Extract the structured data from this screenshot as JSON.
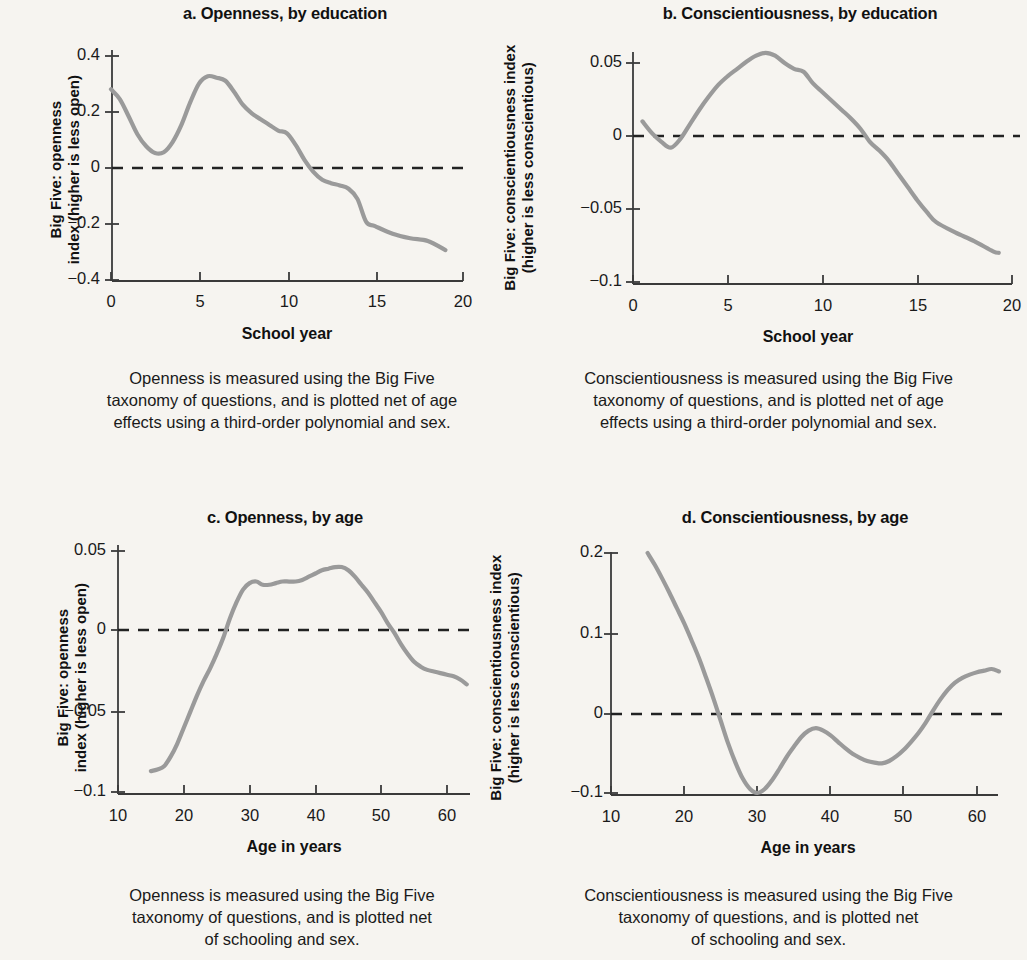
{
  "figure": {
    "background_color": "#f6f4f0",
    "line_color": "#9a9a9a",
    "axis_color": "#3a3a3a"
  },
  "panels": {
    "a": {
      "title": "a. Openness, by education",
      "ylabel_line1": "Big Five: openness",
      "ylabel_line2": "index (higher is less open)",
      "xlabel": "School year",
      "ytick_labels": [
        "0.4",
        "0.2",
        "0",
        "−0.2",
        "−0.4"
      ],
      "xtick_labels": [
        "0",
        "5",
        "10",
        "15",
        "20"
      ],
      "caption_line1": "Openness is measured using the Big Five",
      "caption_line2": "taxonomy of questions, and is plotted net of age",
      "caption_line3": "effects using a third-order polynomial and sex."
    },
    "b": {
      "title": "b. Conscientiousness, by education",
      "ylabel_line1": "Big Five: conscientiousness index",
      "ylabel_line2": "(higher is less conscientious)",
      "xlabel": "School year",
      "ytick_labels": [
        "0.05",
        "0",
        "−0.05",
        "−0.1"
      ],
      "xtick_labels": [
        "0",
        "5",
        "10",
        "15",
        "20"
      ],
      "caption_line1": "Conscientiousness is measured using the Big Five",
      "caption_line2": "taxonomy of questions, and is plotted net of age",
      "caption_line3": "effects using a third-order polynomial and sex."
    },
    "c": {
      "title": "c. Openness, by age",
      "ylabel_line1": "Big Five: openness",
      "ylabel_line2": "index (higher is less open)",
      "xlabel": "Age in years",
      "ytick_labels": [
        "0.05",
        "0",
        "−0.05",
        "−0.1"
      ],
      "xtick_labels": [
        "10",
        "20",
        "30",
        "40",
        "50",
        "60"
      ],
      "caption_line1": "Openness is measured using the Big Five",
      "caption_line2": "taxonomy of questions, and is plotted net",
      "caption_line3": "of schooling and sex."
    },
    "d": {
      "title": "d. Conscientiousness, by age",
      "ylabel_line1": "Big Five: conscientiousness index",
      "ylabel_line2": "(higher is less conscientious)",
      "xlabel": "Age in years",
      "ytick_labels": [
        "0.2",
        "0.1",
        "0",
        "−0.1"
      ],
      "xtick_labels": [
        "10",
        "20",
        "30",
        "40",
        "50",
        "60"
      ],
      "caption_line1": "Conscientiousness is measured using the Big Five",
      "caption_line2": "taxonomy of questions, and is plotted net",
      "caption_line3": "of schooling and sex."
    }
  },
  "chart_data": [
    {
      "type": "line",
      "title": "a. Openness, by education",
      "xlabel": "School year",
      "ylabel": "Big Five: openness index (higher is less open)",
      "xlim": [
        0,
        20
      ],
      "ylim": [
        -0.4,
        0.4
      ],
      "xticks": [
        0,
        5,
        10,
        15,
        20
      ],
      "yticks": [
        0.4,
        0.2,
        0,
        -0.2,
        -0.4
      ],
      "grid": false,
      "legend": null,
      "reference_line_y": 0,
      "x": [
        0,
        0.5,
        1,
        1.5,
        2,
        2.5,
        3,
        3.5,
        4,
        4.5,
        5,
        5.5,
        6,
        6.5,
        7,
        7.5,
        8,
        8.5,
        9,
        9.5,
        10,
        10.5,
        11,
        11.5,
        12,
        12.5,
        13,
        13.5,
        14,
        14.5,
        15,
        16,
        17,
        18,
        19
      ],
      "y": [
        0.282,
        0.247,
        0.186,
        0.122,
        0.079,
        0.055,
        0.058,
        0.094,
        0.155,
        0.235,
        0.302,
        0.328,
        0.323,
        0.312,
        0.272,
        0.226,
        0.196,
        0.175,
        0.155,
        0.135,
        0.125,
        0.083,
        0.03,
        -0.012,
        -0.04,
        -0.052,
        -0.06,
        -0.072,
        -0.108,
        -0.19,
        -0.205,
        -0.232,
        -0.248,
        -0.258,
        -0.29
      ]
    },
    {
      "type": "line",
      "title": "b. Conscientiousness, by education",
      "xlabel": "School year",
      "ylabel": "Big Five: conscientiousness index (higher is less conscientious)",
      "xlim": [
        0,
        20
      ],
      "ylim": [
        -0.1,
        0.065
      ],
      "xticks": [
        0,
        5,
        10,
        15,
        20
      ],
      "yticks": [
        0.05,
        0,
        -0.05,
        -0.1
      ],
      "grid": false,
      "legend": null,
      "reference_line_y": 0,
      "x": [
        0.5,
        1,
        1.5,
        2,
        2.5,
        3,
        3.5,
        4,
        4.5,
        5,
        5.5,
        6,
        6.5,
        7,
        7.5,
        8,
        8.5,
        9,
        9.5,
        10,
        10.5,
        11,
        11.5,
        12,
        12.5,
        13,
        13.5,
        14,
        14.5,
        15,
        15.5,
        16,
        17,
        18,
        19,
        19.3
      ],
      "y": [
        0.01,
        0.002,
        -0.004,
        -0.008,
        -0.002,
        0.008,
        0.018,
        0.027,
        0.035,
        0.041,
        0.046,
        0.051,
        0.055,
        0.057,
        0.055,
        0.05,
        0.046,
        0.044,
        0.036,
        0.03,
        0.024,
        0.018,
        0.012,
        0.005,
        -0.004,
        -0.01,
        -0.017,
        -0.026,
        -0.035,
        -0.044,
        -0.052,
        -0.059,
        -0.066,
        -0.072,
        -0.079,
        -0.08
      ]
    },
    {
      "type": "line",
      "title": "c. Openness, by age",
      "xlabel": "Age in years",
      "ylabel": "Big Five: openness index (higher is less open)",
      "xlim": [
        10,
        64
      ],
      "ylim": [
        -0.1,
        0.055
      ],
      "xticks": [
        10,
        20,
        30,
        40,
        50,
        60
      ],
      "yticks": [
        0.05,
        0,
        -0.05,
        -0.1
      ],
      "grid": false,
      "legend": null,
      "reference_line_y": 0,
      "x": [
        15,
        16,
        17,
        18,
        19,
        20,
        21,
        22,
        23,
        24,
        25,
        26,
        27,
        28,
        29,
        30,
        31,
        32,
        33,
        34,
        35,
        36,
        37,
        38,
        39,
        40,
        41,
        42,
        43,
        44,
        45,
        46,
        47,
        48,
        49,
        50,
        51,
        52,
        53,
        54,
        55,
        56,
        57,
        58,
        59,
        60,
        61,
        62,
        63
      ],
      "y": [
        -0.087,
        -0.086,
        -0.084,
        -0.078,
        -0.07,
        -0.06,
        -0.05,
        -0.04,
        -0.031,
        -0.023,
        -0.014,
        -0.004,
        0.008,
        0.018,
        0.026,
        0.03,
        0.031,
        0.029,
        0.029,
        0.03,
        0.031,
        0.031,
        0.031,
        0.032,
        0.034,
        0.036,
        0.038,
        0.039,
        0.04,
        0.04,
        0.038,
        0.034,
        0.029,
        0.024,
        0.018,
        0.012,
        0.005,
        -0.001,
        -0.008,
        -0.014,
        -0.019,
        -0.022,
        -0.024,
        -0.025,
        -0.026,
        -0.027,
        -0.028,
        -0.03,
        -0.033
      ]
    },
    {
      "type": "line",
      "title": "d. Conscientiousness, by age",
      "xlabel": "Age in years",
      "ylabel": "Big Five: conscientiousness index (higher is less conscientious)",
      "xlim": [
        10,
        64
      ],
      "ylim": [
        -0.105,
        0.205
      ],
      "xticks": [
        10,
        20,
        30,
        40,
        50,
        60
      ],
      "yticks": [
        0.2,
        0.1,
        0,
        -0.1
      ],
      "grid": false,
      "legend": null,
      "reference_line_y": 0,
      "x": [
        15,
        16,
        17,
        18,
        19,
        20,
        21,
        22,
        23,
        24,
        25,
        26,
        27,
        28,
        29,
        30,
        31,
        32,
        33,
        34,
        35,
        36,
        37,
        38,
        39,
        40,
        41,
        42,
        43,
        44,
        45,
        46,
        47,
        48,
        49,
        50,
        51,
        52,
        53,
        54,
        55,
        56,
        57,
        58,
        59,
        60,
        61,
        62,
        63
      ],
      "y": [
        0.2,
        0.185,
        0.168,
        0.15,
        0.131,
        0.112,
        0.091,
        0.069,
        0.044,
        0.018,
        -0.01,
        -0.038,
        -0.062,
        -0.082,
        -0.095,
        -0.1,
        -0.095,
        -0.084,
        -0.07,
        -0.055,
        -0.042,
        -0.03,
        -0.022,
        -0.019,
        -0.022,
        -0.028,
        -0.036,
        -0.044,
        -0.051,
        -0.056,
        -0.06,
        -0.062,
        -0.063,
        -0.06,
        -0.054,
        -0.046,
        -0.036,
        -0.025,
        -0.012,
        0.003,
        0.017,
        0.029,
        0.038,
        0.044,
        0.048,
        0.051,
        0.053,
        0.055,
        0.052
      ]
    }
  ]
}
